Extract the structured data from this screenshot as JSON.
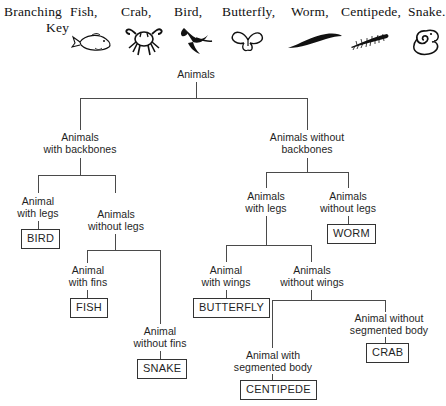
{
  "key": {
    "title_line1": "Branching",
    "title_line2": "Key",
    "terms": [
      {
        "label": "Fish,",
        "icon": "fish-icon"
      },
      {
        "label": "Crab,",
        "icon": "crab-icon"
      },
      {
        "label": "Bird,",
        "icon": "bird-icon"
      },
      {
        "label": "Butterfly,",
        "icon": "butterfly-icon"
      },
      {
        "label": "Worm,",
        "icon": "worm-icon"
      },
      {
        "label": "Centipede,",
        "icon": "centipede-icon"
      },
      {
        "label": "Snake.",
        "icon": "snake-icon"
      }
    ]
  },
  "tree": {
    "root": "Animals",
    "nodes": {
      "with_backbones": "Animals\nwith backbones",
      "without_backbones": "Animals without\nbackbones",
      "animal_with_legs_vert": "Animal\nwith legs",
      "animals_without_legs_vert": "Animals\nwithout legs",
      "animal_with_fins": "Animal\nwith fins",
      "animal_without_fins": "Animal\nwithout fins",
      "animals_with_legs_inv": "Animals\nwith legs",
      "animals_without_legs_inv": "Animals\nwithout legs",
      "animal_with_wings": "Animal\nwith wings",
      "animals_without_wings": "Animals\nwithout wings",
      "animal_with_segmented": "Animal with\nsegmented body",
      "animal_without_segmented": "Animal without\nsegmented body"
    },
    "leaves": {
      "bird": "BIRD",
      "fish": "FISH",
      "snake": "SNAKE",
      "worm": "WORM",
      "butterfly": "BUTTERFLY",
      "centipede": "CENTIPEDE",
      "crab": "CRAB"
    }
  },
  "colors": {
    "line": "#4a4a4a",
    "text": "#1f1f1f",
    "box_border": "#333333"
  }
}
